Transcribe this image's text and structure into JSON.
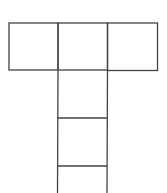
{
  "diagram": {
    "stroke_color": "#444444",
    "background": "#ffffff",
    "top_row_squares": 3,
    "column_squares_below": 3
  }
}
